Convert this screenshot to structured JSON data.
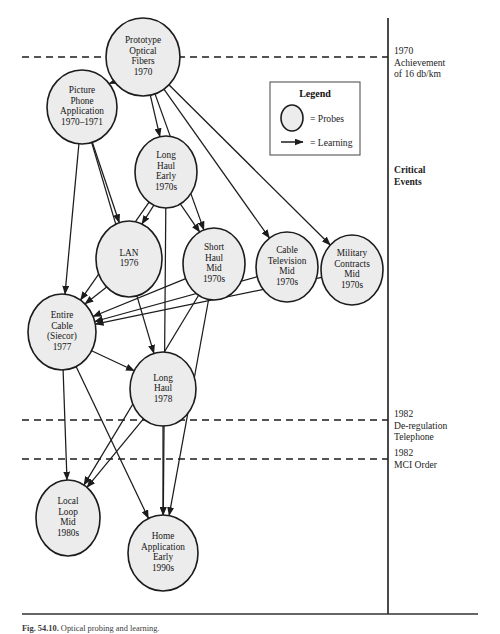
{
  "figure": {
    "caption_label": "Fig. 54.10.",
    "caption_text": "Optical probing and learning."
  },
  "legend": {
    "title": "Legend",
    "probes_label": "= Probes",
    "learning_label": "= Learning",
    "probe_icon": "ellipse-icon",
    "learning_icon": "arrow-icon"
  },
  "axis": {
    "title": "Critical\nEvents",
    "events": [
      {
        "id": "e1970",
        "text": "1970\nAchievement\nof 16 db/km",
        "y": 57
      },
      {
        "id": "e1982dereg",
        "text": "1982\nDe-regulation\nTelephone",
        "y": 420
      },
      {
        "id": "e1982mci",
        "text": "1982\nMCI Order",
        "y": 459
      }
    ]
  },
  "nodes": [
    {
      "id": "prototype-optical-fibers",
      "lines": [
        "Prototype",
        "Optical",
        "Fibers",
        "1970"
      ],
      "cx": 143,
      "cy": 57,
      "rx": 37,
      "ry": 39
    },
    {
      "id": "picture-phone-application",
      "lines": [
        "Picture",
        "Phone",
        "Application",
        "1970–1971"
      ],
      "cx": 82,
      "cy": 107,
      "rx": 35,
      "ry": 37
    },
    {
      "id": "long-haul-early-1970s",
      "lines": [
        "Long",
        "Haul",
        "Early",
        "1970s"
      ],
      "cx": 166,
      "cy": 172,
      "rx": 31,
      "ry": 36
    },
    {
      "id": "lan-1976",
      "lines": [
        "LAN",
        "1976"
      ],
      "cx": 129,
      "cy": 259,
      "rx": 33,
      "ry": 38
    },
    {
      "id": "short-haul-mid-1970s",
      "lines": [
        "Short",
        "Haul",
        "Mid",
        "1970s"
      ],
      "cx": 214,
      "cy": 264,
      "rx": 31,
      "ry": 36
    },
    {
      "id": "cable-television-mid-1970s",
      "lines": [
        "Cable",
        "Television",
        "Mid",
        "1970s"
      ],
      "cx": 287,
      "cy": 267,
      "rx": 31,
      "ry": 35
    },
    {
      "id": "military-contracts-mid-1970s",
      "lines": [
        "Military",
        "Contracts",
        "Mid",
        "1970s"
      ],
      "cx": 352,
      "cy": 270,
      "rx": 31,
      "ry": 35
    },
    {
      "id": "entire-cable-siecor-1977",
      "lines": [
        "Entire",
        "Cable",
        "(Siecor)",
        "1977"
      ],
      "cx": 62,
      "cy": 332,
      "rx": 34,
      "ry": 38
    },
    {
      "id": "long-haul-1978",
      "lines": [
        "Long",
        "Haul",
        "1978"
      ],
      "cx": 163,
      "cy": 389,
      "rx": 33,
      "ry": 37
    },
    {
      "id": "local-loop-mid-1980s",
      "lines": [
        "Local",
        "Loop",
        "Mid",
        "1980s"
      ],
      "cx": 68,
      "cy": 518,
      "rx": 32,
      "ry": 38
    },
    {
      "id": "home-application-early-1990s",
      "lines": [
        "Home",
        "Application",
        "Early",
        "1990s"
      ],
      "cx": 163,
      "cy": 553,
      "rx": 35,
      "ry": 38
    }
  ],
  "edges": [
    {
      "from": "prototype-optical-fibers",
      "to": "picture-phone-application"
    },
    {
      "from": "prototype-optical-fibers",
      "to": "long-haul-early-1970s"
    },
    {
      "from": "prototype-optical-fibers",
      "to": "short-haul-mid-1970s"
    },
    {
      "from": "prototype-optical-fibers",
      "to": "cable-television-mid-1970s"
    },
    {
      "from": "prototype-optical-fibers",
      "to": "military-contracts-mid-1970s"
    },
    {
      "from": "picture-phone-application",
      "to": "lan-1976"
    },
    {
      "from": "picture-phone-application",
      "to": "entire-cable-siecor-1977"
    },
    {
      "from": "picture-phone-application",
      "to": "long-haul-1978"
    },
    {
      "from": "long-haul-early-1970s",
      "to": "lan-1976"
    },
    {
      "from": "long-haul-early-1970s",
      "to": "short-haul-mid-1970s"
    },
    {
      "from": "long-haul-early-1970s",
      "to": "entire-cable-siecor-1977"
    },
    {
      "from": "long-haul-early-1970s",
      "to": "home-application-early-1990s"
    },
    {
      "from": "lan-1976",
      "to": "entire-cable-siecor-1977"
    },
    {
      "from": "short-haul-mid-1970s",
      "to": "entire-cable-siecor-1977"
    },
    {
      "from": "cable-television-mid-1970s",
      "to": "entire-cable-siecor-1977"
    },
    {
      "from": "military-contracts-mid-1970s",
      "to": "entire-cable-siecor-1977"
    },
    {
      "from": "entire-cable-siecor-1977",
      "to": "long-haul-1978"
    },
    {
      "from": "entire-cable-siecor-1977",
      "to": "local-loop-mid-1980s"
    },
    {
      "from": "entire-cable-siecor-1977",
      "to": "home-application-early-1990s"
    },
    {
      "from": "long-haul-1978",
      "to": "local-loop-mid-1980s"
    },
    {
      "from": "long-haul-1978",
      "to": "home-application-early-1990s"
    },
    {
      "from": "short-haul-mid-1970s",
      "to": "local-loop-mid-1980s"
    },
    {
      "from": "short-haul-mid-1970s",
      "to": "home-application-early-1990s"
    }
  ],
  "colors": {
    "node_fill": "#ececec",
    "stroke": "#1c1c1c",
    "background": "#ffffff"
  }
}
